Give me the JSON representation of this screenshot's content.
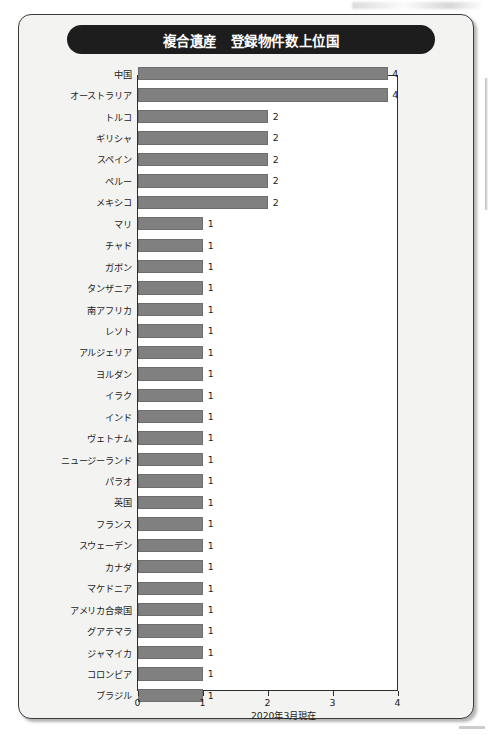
{
  "figure": {
    "title": "複合遺産　登録物件数上位国",
    "footnote": "2020年3月現在"
  },
  "colors": {
    "banner_bg": "#1d1d1d",
    "banner_text": "#ffffff",
    "bar_fill": "#808080",
    "bar_stroke": "#6e6e6e",
    "card_bg": "#f3f3f1",
    "plot_bg": "#ffffff",
    "axis": "#2e2e2e",
    "text": "#1c1c1c"
  },
  "chart_data": {
    "type": "bar",
    "orientation": "horizontal",
    "title": "複合遺産　登録物件数上位国",
    "xlabel": "",
    "ylabel": "",
    "xlim": [
      0,
      4
    ],
    "xticks": [
      "0",
      "1",
      "2",
      "3",
      "4"
    ],
    "grid": false,
    "legend": null,
    "annotation": "2020年3月現在",
    "categories": [
      "中国",
      "オーストラリア",
      "トルコ",
      "ギリシャ",
      "スペイン",
      "ペルー",
      "メキシコ",
      "マリ",
      "チャド",
      "ガボン",
      "タンザニア",
      "南アフリカ",
      "レソト",
      "アルジェリア",
      "ヨルダン",
      "イラク",
      "インド",
      "ヴェトナム",
      "ニュージーランド",
      "パラオ",
      "英国",
      "フランス",
      "スウェーデン",
      "カナダ",
      "マケドニア",
      "アメリカ合衆国",
      "グアテマラ",
      "ジャマイカ",
      "コロンビア",
      "ブラジル"
    ],
    "values": [
      4,
      4,
      2,
      2,
      2,
      2,
      2,
      1,
      1,
      1,
      1,
      1,
      1,
      1,
      1,
      1,
      1,
      1,
      1,
      1,
      1,
      1,
      1,
      1,
      1,
      1,
      1,
      1,
      1,
      1
    ],
    "value_labels": [
      "4",
      "4",
      "2",
      "2",
      "2",
      "2",
      "2",
      "1",
      "1",
      "1",
      "1",
      "1",
      "1",
      "1",
      "1",
      "1",
      "1",
      "1",
      "1",
      "1",
      "1",
      "1",
      "1",
      "1",
      "1",
      "1",
      "1",
      "1",
      "1",
      "1"
    ]
  }
}
